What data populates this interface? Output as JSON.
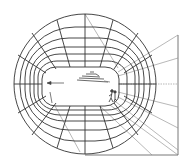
{
  "diagram": {
    "title": "",
    "colors": {
      "background": "#ffffff",
      "grid": "#333333",
      "radial": "#777777",
      "figure": "#444444"
    },
    "outer_ellipse": {
      "cx": 85,
      "cy": 84,
      "rx": 71,
      "ry": 70
    },
    "inner_opening": {
      "x": 42,
      "y": 67,
      "width": 77,
      "height": 39,
      "rx": 14
    },
    "frame": {
      "right_x": 178,
      "top_y": 35,
      "bottom_y": 155,
      "left_x": 85
    },
    "elements": {
      "ship": "ship-sketch",
      "figure": "standing-figure",
      "arrow": "left-arrow"
    }
  }
}
